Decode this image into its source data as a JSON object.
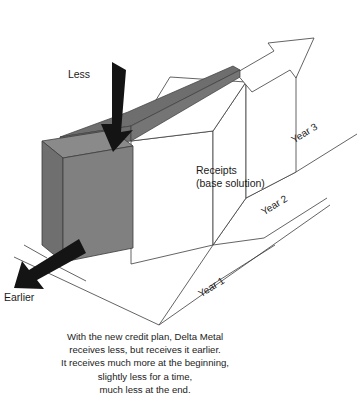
{
  "figure": {
    "type": "isometric-3d-bar-diagram"
  },
  "colors": {
    "solid_gray": "#808080",
    "wedge_gray": "#6e6e6e",
    "outline": "#3c3c3c",
    "arrow_black": "#141414",
    "background": "#ffffff",
    "text": "#1b1b1b"
  },
  "annotations": {
    "less_label": "Less",
    "earlier_label": "Earlier",
    "receipts_line1": "Receipts",
    "receipts_line2": "(base solution)"
  },
  "timeline": {
    "labels": [
      "Year 1",
      "Year 2",
      "Year 3"
    ]
  },
  "caption": {
    "lines": [
      "With the new credit plan, Delta Metal",
      "receives less, but receives it earlier.",
      "It receives much more at the beginning,",
      "slightly less for a time,",
      "much less at the end."
    ]
  },
  "icons": {
    "down_arrow": "down-arrow-icon",
    "diagonal_arrow": "diagonal-arrow-icon",
    "timeline_arrow": "timeline-arrow-icon"
  }
}
